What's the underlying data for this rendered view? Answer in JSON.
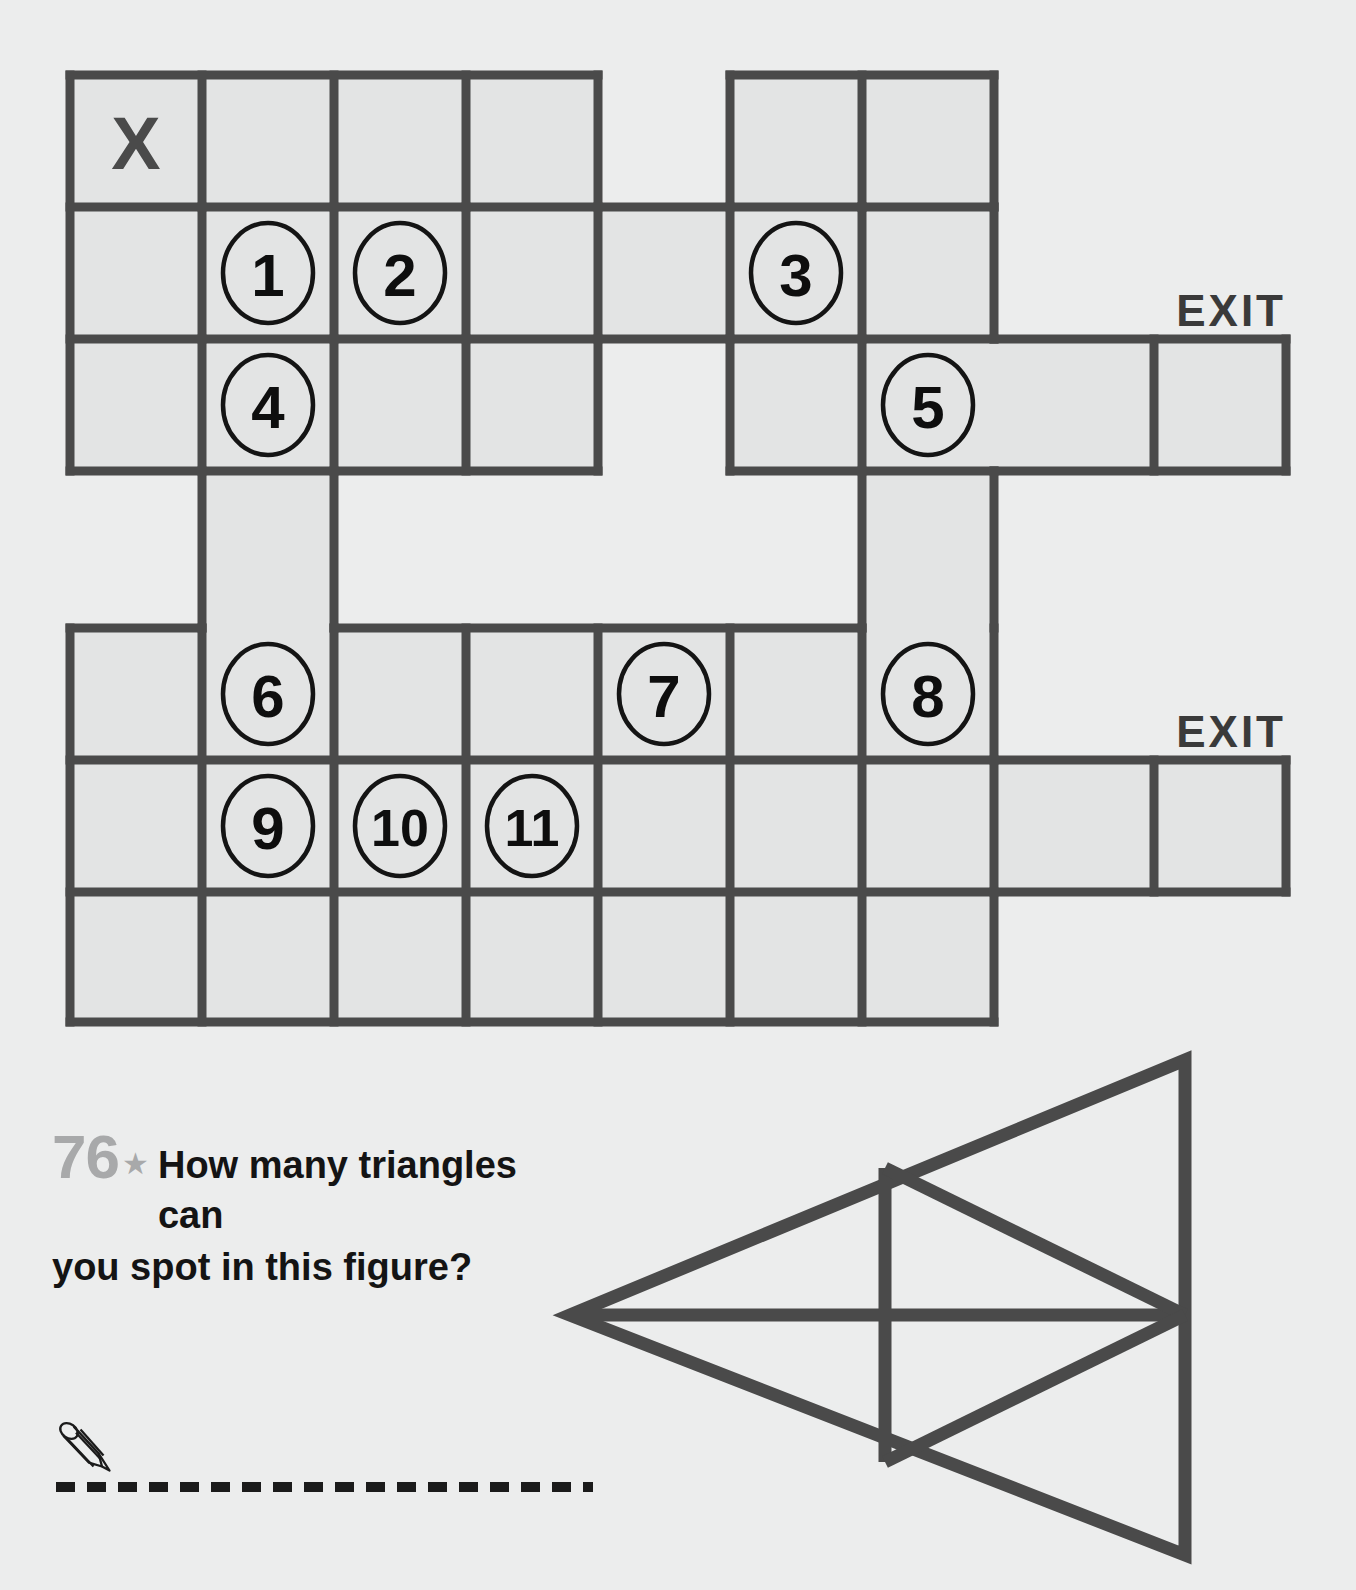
{
  "page": {
    "background_color": "#eceded",
    "line_color": "#4a4a4a",
    "cell_fill_color": "#e3e4e4"
  },
  "maze": {
    "start_marker": "X",
    "exit_labels": [
      "EXIT",
      "EXIT"
    ],
    "node_labels": [
      "1",
      "2",
      "3",
      "4",
      "5",
      "6",
      "7",
      "8",
      "9",
      "10",
      "11"
    ],
    "nodes": [
      {
        "label": "1",
        "col": 2,
        "row": 2
      },
      {
        "label": "2",
        "col": 3,
        "row": 2
      },
      {
        "label": "3",
        "col": 6,
        "row": 2
      },
      {
        "label": "4",
        "col": 2,
        "row": 3
      },
      {
        "label": "5",
        "col": 7,
        "row": 3
      },
      {
        "label": "6",
        "col": 2,
        "row": 5
      },
      {
        "label": "7",
        "col": 5,
        "row": 5
      },
      {
        "label": "8",
        "col": 7,
        "row": 5
      },
      {
        "label": "9",
        "col": 2,
        "row": 6
      },
      {
        "label": "10",
        "col": 3,
        "row": 6
      },
      {
        "label": "11",
        "col": 4,
        "row": 6
      }
    ]
  },
  "puzzle": {
    "number": "76",
    "star": "★",
    "question_line1": "How many triangles can",
    "question_line2": "you spot in this figure?"
  },
  "answer": {
    "pencil_icon": "pencil-icon",
    "dashed_line": "answer-dashed-line"
  },
  "figure": {
    "name": "triangle-count-figure"
  }
}
